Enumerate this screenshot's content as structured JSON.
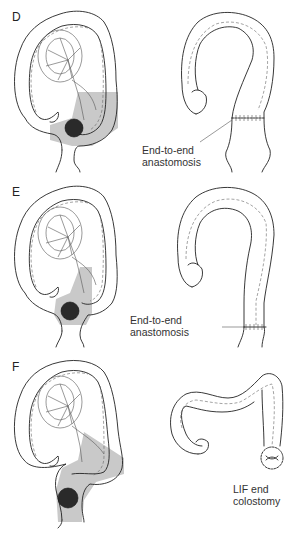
{
  "figure": {
    "panels": [
      {
        "id": "D",
        "letter": "D",
        "annotation": "End-to-end\nanastomosis",
        "annotation_line1": "End-to-end",
        "annotation_line2": "anastomosis",
        "result": "anastomosis"
      },
      {
        "id": "E",
        "letter": "E",
        "annotation_line1": "End-to-end",
        "annotation_line2": "anastomosis",
        "result": "anastomosis"
      },
      {
        "id": "F",
        "letter": "F",
        "annotation_line1": "LIF end",
        "annotation_line2": "colostomy",
        "result": "colostomy"
      }
    ],
    "colors": {
      "line": "#222222",
      "resection_shade": "#c9c9c9",
      "tumor": "#2a2a2a",
      "background": "#ffffff"
    }
  }
}
